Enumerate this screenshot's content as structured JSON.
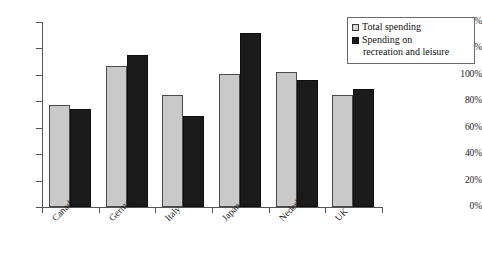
{
  "chart_data": {
    "type": "bar",
    "title": "",
    "xlabel": "",
    "ylabel": "",
    "categories": [
      "Canada",
      "Germany",
      "Italy",
      "Japan",
      "Nederlands",
      "UK"
    ],
    "series": [
      {
        "name": "Total spending",
        "color": "#c9c9c9",
        "values": [
          77,
          107,
          85,
          101,
          102,
          85
        ]
      },
      {
        "name": "Spending on recreation and leisure",
        "color": "#1b1b1b",
        "values": [
          74,
          115,
          69,
          132,
          96,
          89
        ]
      }
    ],
    "ylim": [
      0,
      140
    ],
    "ytick_values": [
      0,
      20,
      40,
      60,
      80,
      100,
      120,
      140
    ],
    "ytick_labels": [
      "0%",
      "20%",
      "40%",
      "60%",
      "80%",
      "100%",
      "120%",
      "140%"
    ],
    "grid": false,
    "legend_position": "top-right",
    "legend_entries": [
      {
        "label": "Total spending",
        "label_line1": "Total spending",
        "label_line2": "",
        "swatch": "light-gray-square"
      },
      {
        "label": "Spending on recreation and leisure",
        "label_line1": "Spending on",
        "label_line2": "recreation and leisure",
        "swatch": "black-square"
      }
    ]
  }
}
